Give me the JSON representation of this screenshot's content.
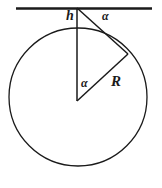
{
  "figure": {
    "type": "geometry-diagram",
    "stroke_color": "#1a1a1a",
    "background_color": "#ffffff",
    "labels": {
      "height": "h",
      "angle_top": "α",
      "angle_center": "α",
      "radius": "R"
    },
    "geometry": {
      "circle": {
        "cx": 78,
        "cy": 97,
        "r": 69
      },
      "tangent_line": {
        "x1": 16,
        "y1": 8,
        "x2": 152,
        "y2": 8
      },
      "vertical_segment": {
        "x1": 77,
        "y1": 8,
        "x2": 77,
        "y2": 101
      },
      "chord_segment": {
        "x1": 77,
        "y1": 8,
        "x2": 128,
        "y2": 54
      },
      "radius_segment": {
        "x1": 77,
        "y1": 101,
        "x2": 128,
        "y2": 54
      }
    }
  }
}
